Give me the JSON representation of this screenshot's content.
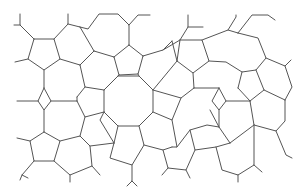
{
  "diagram": {
    "title": "",
    "width": 304,
    "height": 194,
    "background": "#ffffff",
    "stroke": "#555555",
    "stroke_width": 1,
    "polylines": [
      [
        [
          34,
          39
        ],
        [
          54,
          39
        ],
        [
          60,
          59
        ],
        [
          44,
          70
        ],
        [
          28,
          59
        ],
        [
          34,
          39
        ]
      ],
      [
        [
          34,
          39
        ],
        [
          20,
          25
        ],
        [
          20,
          14
        ]
      ],
      [
        [
          20,
          25
        ],
        [
          14,
          25
        ]
      ],
      [
        [
          54,
          39
        ],
        [
          68,
          24
        ],
        [
          68,
          14
        ]
      ],
      [
        [
          68,
          24
        ],
        [
          80,
          27
        ]
      ],
      [
        [
          28,
          59
        ],
        [
          15,
          62
        ]
      ],
      [
        [
          60,
          59
        ],
        [
          80,
          65
        ]
      ],
      [
        [
          44,
          70
        ],
        [
          44,
          88
        ]
      ],
      [
        [
          80,
          27
        ],
        [
          88,
          29
        ],
        [
          99,
          14
        ],
        [
          118,
          14
        ],
        [
          129,
          25
        ],
        [
          129,
          45
        ]
      ],
      [
        [
          80,
          27
        ],
        [
          94,
          51
        ]
      ],
      [
        [
          94,
          51
        ],
        [
          80,
          65
        ]
      ],
      [
        [
          94,
          51
        ],
        [
          114,
          57
        ]
      ],
      [
        [
          129,
          45
        ],
        [
          114,
          57
        ]
      ],
      [
        [
          129,
          45
        ],
        [
          143,
          56
        ]
      ],
      [
        [
          114,
          57
        ],
        [
          119,
          75
        ],
        [
          138,
          74
        ],
        [
          143,
          56
        ]
      ],
      [
        [
          119,
          75
        ],
        [
          104,
          90
        ]
      ],
      [
        [
          138,
          74
        ],
        [
          139,
          76
        ]
      ],
      [
        [
          119,
          75
        ],
        [
          118,
          76
        ]
      ],
      [
        [
          80,
          65
        ],
        [
          85,
          87
        ],
        [
          104,
          90
        ]
      ],
      [
        [
          85,
          87
        ],
        [
          77,
          97
        ]
      ],
      [
        [
          118,
          76
        ],
        [
          139,
          76
        ],
        [
          153,
          90
        ],
        [
          153,
          112
        ],
        [
          139,
          126
        ],
        [
          118,
          126
        ],
        [
          104,
          112
        ],
        [
          104,
          90
        ],
        [
          118,
          76
        ]
      ],
      [
        [
          129,
          25
        ],
        [
          138,
          15
        ],
        [
          150,
          15
        ]
      ],
      [
        [
          143,
          56
        ],
        [
          163,
          50
        ],
        [
          172,
          41
        ]
      ],
      [
        [
          163,
          50
        ],
        [
          180,
          40
        ],
        [
          188,
          27
        ],
        [
          188,
          15
        ]
      ],
      [
        [
          188,
          27
        ],
        [
          203,
          27
        ]
      ],
      [
        [
          180,
          40
        ],
        [
          202,
          40
        ],
        [
          209,
          61
        ],
        [
          193,
          73
        ],
        [
          177,
          61
        ],
        [
          180,
          40
        ]
      ],
      [
        [
          202,
          40
        ],
        [
          228,
          30
        ],
        [
          238,
          33
        ]
      ],
      [
        [
          228,
          30
        ],
        [
          236,
          17
        ],
        [
          236,
          15
        ]
      ],
      [
        [
          238,
          33
        ],
        [
          252,
          15
        ],
        [
          268,
          15
        ],
        [
          275,
          20
        ]
      ],
      [
        [
          238,
          33
        ],
        [
          258,
          38
        ],
        [
          266,
          58
        ],
        [
          256,
          70
        ],
        [
          242,
          72
        ],
        [
          226,
          62
        ],
        [
          209,
          61
        ]
      ],
      [
        [
          172,
          41
        ],
        [
          177,
          61
        ]
      ],
      [
        [
          153,
          90
        ],
        [
          177,
          61
        ]
      ],
      [
        [
          193,
          73
        ],
        [
          194,
          88
        ]
      ],
      [
        [
          266,
          58
        ],
        [
          285,
          66
        ],
        [
          291,
          60
        ]
      ],
      [
        [
          285,
          66
        ],
        [
          292,
          87
        ],
        [
          285,
          100
        ]
      ],
      [
        [
          256,
          70
        ],
        [
          264,
          90
        ],
        [
          285,
          100
        ]
      ],
      [
        [
          242,
          72
        ],
        [
          238,
          88
        ]
      ],
      [
        [
          44,
          88
        ],
        [
          38,
          101
        ],
        [
          44,
          110
        ],
        [
          51,
          101
        ],
        [
          44,
          88
        ]
      ],
      [
        [
          38,
          101
        ],
        [
          17,
          101
        ]
      ],
      [
        [
          51,
          101
        ],
        [
          77,
          101
        ]
      ],
      [
        [
          77,
          97
        ],
        [
          77,
          101
        ]
      ],
      [
        [
          44,
          110
        ],
        [
          44,
          132
        ]
      ],
      [
        [
          77,
          101
        ],
        [
          85,
          117
        ],
        [
          104,
          112
        ]
      ],
      [
        [
          194,
          88
        ],
        [
          219,
          88
        ]
      ],
      [
        [
          153,
          90
        ],
        [
          181,
          98
        ],
        [
          194,
          88
        ]
      ],
      [
        [
          219,
          88
        ],
        [
          212,
          101
        ],
        [
          219,
          110
        ],
        [
          226,
          101
        ],
        [
          219,
          88
        ]
      ],
      [
        [
          226,
          101
        ],
        [
          250,
          101
        ]
      ],
      [
        [
          238,
          88
        ],
        [
          250,
          101
        ]
      ],
      [
        [
          264,
          90
        ],
        [
          250,
          101
        ]
      ],
      [
        [
          219,
          110
        ],
        [
          219,
          127
        ]
      ],
      [
        [
          250,
          101
        ],
        [
          254,
          125
        ],
        [
          276,
          131
        ],
        [
          285,
          121
        ],
        [
          285,
          100
        ]
      ],
      [
        [
          276,
          131
        ],
        [
          286,
          155
        ],
        [
          292,
          158
        ]
      ],
      [
        [
          44,
          132
        ],
        [
          30,
          141
        ],
        [
          34,
          161
        ],
        [
          54,
          161
        ],
        [
          60,
          141
        ],
        [
          44,
          132
        ]
      ],
      [
        [
          30,
          141
        ],
        [
          17,
          138
        ]
      ],
      [
        [
          34,
          161
        ],
        [
          22,
          175
        ],
        [
          20,
          180
        ]
      ],
      [
        [
          22,
          175
        ],
        [
          28,
          178
        ]
      ],
      [
        [
          60,
          141
        ],
        [
          80,
          136
        ],
        [
          90,
          146
        ],
        [
          92,
          166
        ],
        [
          70,
          175
        ],
        [
          54,
          161
        ]
      ],
      [
        [
          85,
          117
        ],
        [
          80,
          136
        ]
      ],
      [
        [
          70,
          175
        ],
        [
          70,
          182
        ]
      ],
      [
        [
          90,
          146
        ],
        [
          114,
          143
        ]
      ],
      [
        [
          92,
          166
        ],
        [
          100,
          175
        ]
      ],
      [
        [
          104,
          112
        ],
        [
          100,
          120
        ],
        [
          114,
          143
        ]
      ],
      [
        [
          114,
          143
        ],
        [
          110,
          158
        ],
        [
          132,
          165
        ],
        [
          144,
          145
        ],
        [
          139,
          126
        ]
      ],
      [
        [
          118,
          126
        ],
        [
          114,
          143
        ]
      ],
      [
        [
          132,
          165
        ],
        [
          132,
          181
        ],
        [
          127,
          186
        ]
      ],
      [
        [
          132,
          181
        ],
        [
          137,
          186
        ]
      ],
      [
        [
          144,
          145
        ],
        [
          163,
          150
        ],
        [
          172,
          147
        ]
      ],
      [
        [
          153,
          112
        ],
        [
          172,
          120
        ],
        [
          181,
          98
        ]
      ],
      [
        [
          172,
          120
        ],
        [
          177,
          147
        ],
        [
          172,
          147
        ]
      ],
      [
        [
          177,
          147
        ],
        [
          190,
          130
        ],
        [
          207,
          125
        ],
        [
          219,
          127
        ],
        [
          230,
          143
        ]
      ],
      [
        [
          190,
          130
        ],
        [
          195,
          150
        ],
        [
          216,
          147
        ],
        [
          230,
          143
        ]
      ],
      [
        [
          163,
          150
        ],
        [
          168,
          168
        ],
        [
          186,
          170
        ],
        [
          195,
          150
        ]
      ],
      [
        [
          168,
          168
        ],
        [
          162,
          175
        ]
      ],
      [
        [
          186,
          170
        ],
        [
          190,
          178
        ]
      ],
      [
        [
          216,
          147
        ],
        [
          222,
          170
        ],
        [
          238,
          175
        ],
        [
          254,
          165
        ],
        [
          254,
          125
        ]
      ],
      [
        [
          230,
          143
        ],
        [
          254,
          125
        ]
      ],
      [
        [
          238,
          175
        ],
        [
          238,
          182
        ]
      ],
      [
        [
          254,
          165
        ],
        [
          262,
          172
        ]
      ],
      [
        [
          219,
          127
        ],
        [
          210,
          110
        ]
      ]
    ]
  }
}
